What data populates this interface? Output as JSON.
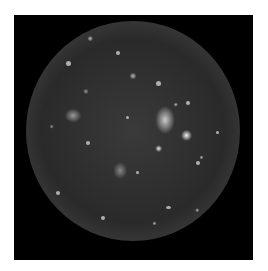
{
  "image": {
    "description": "Grayscale photograph of a heavily cratered moon on a black square background",
    "background_color": "#000000",
    "margin_color": "#ffffff"
  }
}
